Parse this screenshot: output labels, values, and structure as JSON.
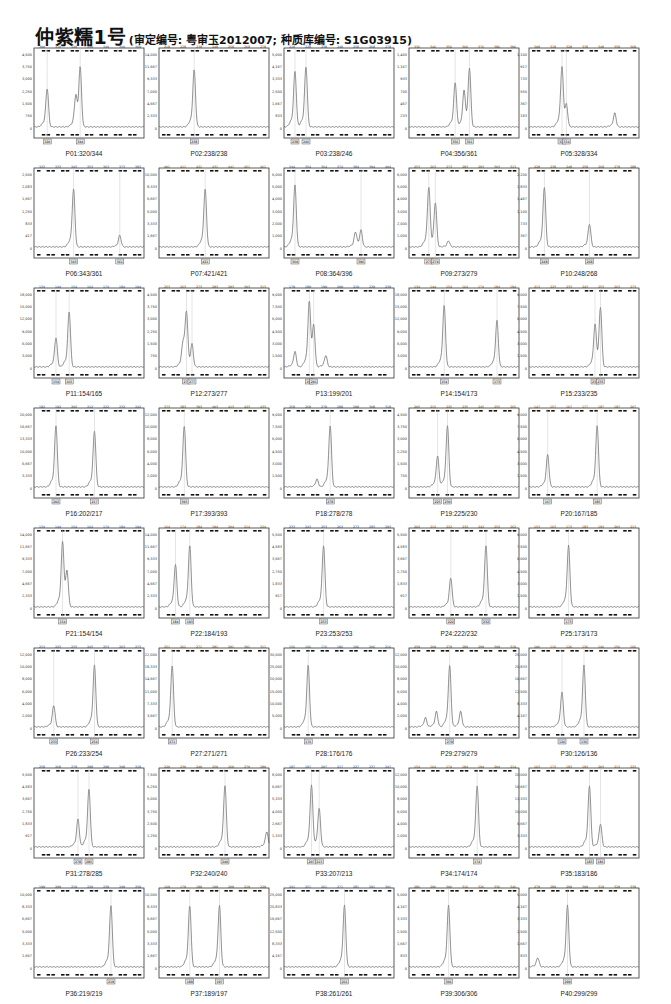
{
  "header": {
    "title": "仲紫糯1号",
    "subtitle": "(审定编号: 粤审玉2012007; 种质库编号: S1G03915)"
  },
  "chart_data": {
    "type": "line",
    "layout": {
      "rows": 8,
      "cols": 5,
      "grid": false,
      "legend": "none"
    },
    "panels": [
      {
        "id": "P01",
        "label": "P01:320/344",
        "alleles": [
          320,
          344
        ],
        "ymax": 4500,
        "peaks": [
          {
            "x": 0.12,
            "h": 0.5
          },
          {
            "x": 0.38,
            "h": 0.34
          },
          {
            "x": 0.42,
            "h": 0.78
          }
        ]
      },
      {
        "id": "P02",
        "label": "P02:238/238",
        "alleles": [
          238,
          238
        ],
        "ymax": 14000,
        "peaks": [
          {
            "x": 0.32,
            "h": 0.74
          }
        ]
      },
      {
        "id": "P03",
        "label": "P03:238/246",
        "alleles": [
          238,
          246
        ],
        "ymax": 5000,
        "peaks": [
          {
            "x": 0.1,
            "h": 0.72
          },
          {
            "x": 0.2,
            "h": 0.78
          }
        ]
      },
      {
        "id": "P04",
        "label": "P04:356/361",
        "alleles": [
          356,
          361
        ],
        "ymax": 1400,
        "peaks": [
          {
            "x": 0.42,
            "h": 0.58
          },
          {
            "x": 0.5,
            "h": 0.42
          },
          {
            "x": 0.55,
            "h": 0.77
          }
        ]
      },
      {
        "id": "P05",
        "label": "P05:328/334",
        "alleles": [
          328,
          334
        ],
        "ymax": 1100,
        "peaks": [
          {
            "x": 0.3,
            "h": 0.75
          },
          {
            "x": 0.34,
            "h": 0.3
          },
          {
            "x": 0.78,
            "h": 0.18
          }
        ]
      },
      {
        "id": "P06",
        "label": "P06:343/361",
        "alleles": [
          343,
          361
        ],
        "ymax": 2500,
        "peaks": [
          {
            "x": 0.36,
            "h": 0.75
          },
          {
            "x": 0.78,
            "h": 0.15
          }
        ]
      },
      {
        "id": "P07",
        "label": "P07:421/421",
        "alleles": [
          421,
          421
        ],
        "ymax": 10000,
        "peaks": [
          {
            "x": 0.42,
            "h": 0.75
          }
        ]
      },
      {
        "id": "P08",
        "label": "P08:364/396",
        "alleles": [
          364,
          396
        ],
        "ymax": 6000,
        "peaks": [
          {
            "x": 0.1,
            "h": 0.8
          },
          {
            "x": 0.65,
            "h": 0.18
          },
          {
            "x": 0.7,
            "h": 0.22
          }
        ]
      },
      {
        "id": "P09",
        "label": "P09:273/279",
        "alleles": [
          273,
          279
        ],
        "ymax": 6000,
        "peaks": [
          {
            "x": 0.18,
            "h": 0.76
          },
          {
            "x": 0.24,
            "h": 0.58
          },
          {
            "x": 0.36,
            "h": 0.08
          }
        ]
      },
      {
        "id": "P10",
        "label": "P10:248/268",
        "alleles": [
          248,
          268
        ],
        "ymax": 2200,
        "peaks": [
          {
            "x": 0.14,
            "h": 0.78
          },
          {
            "x": 0.55,
            "h": 0.3
          }
        ]
      },
      {
        "id": "P11",
        "label": "P11:154/165",
        "alleles": [
          154,
          165
        ],
        "ymax": 18000,
        "peaks": [
          {
            "x": 0.2,
            "h": 0.38
          },
          {
            "x": 0.32,
            "h": 0.72
          }
        ]
      },
      {
        "id": "P12",
        "label": "P12:273/277",
        "alleles": [
          273,
          277
        ],
        "ymax": 4500,
        "peaks": [
          {
            "x": 0.22,
            "h": 0.25
          },
          {
            "x": 0.25,
            "h": 0.7
          },
          {
            "x": 0.3,
            "h": 0.3
          }
        ]
      },
      {
        "id": "P13",
        "label": "P13:199/201",
        "alleles": [
          199,
          201
        ],
        "ymax": 9000,
        "peaks": [
          {
            "x": 0.1,
            "h": 0.2
          },
          {
            "x": 0.23,
            "h": 0.8
          },
          {
            "x": 0.27,
            "h": 0.55
          },
          {
            "x": 0.38,
            "h": 0.15
          }
        ]
      },
      {
        "id": "P14",
        "label": "P14:154/173",
        "alleles": [
          154,
          173
        ],
        "ymax": 18000,
        "peaks": [
          {
            "x": 0.32,
            "h": 0.8
          },
          {
            "x": 0.8,
            "h": 0.6
          }
        ]
      },
      {
        "id": "P15",
        "label": "P15:233/235",
        "alleles": [
          233,
          235
        ],
        "ymax": 9000,
        "peaks": [
          {
            "x": 0.6,
            "h": 0.5
          },
          {
            "x": 0.65,
            "h": 0.78
          }
        ]
      },
      {
        "id": "P16",
        "label": "P16:202/217",
        "alleles": [
          202,
          217
        ],
        "ymax": 20000,
        "peaks": [
          {
            "x": 0.2,
            "h": 0.8
          },
          {
            "x": 0.55,
            "h": 0.73
          }
        ]
      },
      {
        "id": "P17",
        "label": "P17:393/393",
        "alleles": [
          393,
          393
        ],
        "ymax": 12000,
        "peaks": [
          {
            "x": 0.23,
            "h": 0.8
          }
        ]
      },
      {
        "id": "P18",
        "label": "P18:278/278",
        "alleles": [
          278,
          278
        ],
        "ymax": 9000,
        "peaks": [
          {
            "x": 0.3,
            "h": 0.1
          },
          {
            "x": 0.42,
            "h": 0.8
          }
        ]
      },
      {
        "id": "P19",
        "label": "P19:225/230",
        "alleles": [
          225,
          230
        ],
        "ymax": 4500,
        "peaks": [
          {
            "x": 0.26,
            "h": 0.4
          },
          {
            "x": 0.35,
            "h": 0.8
          }
        ]
      },
      {
        "id": "P20",
        "label": "P20:167/185",
        "alleles": [
          167,
          185
        ],
        "ymax": 9000,
        "peaks": [
          {
            "x": 0.17,
            "h": 0.42
          },
          {
            "x": 0.62,
            "h": 0.8
          }
        ]
      },
      {
        "id": "P21",
        "label": "P21:154/154",
        "alleles": [
          154,
          154
        ],
        "ymax": 14000,
        "peaks": [
          {
            "x": 0.26,
            "h": 0.8
          },
          {
            "x": 0.3,
            "h": 0.48
          }
        ]
      },
      {
        "id": "P22",
        "label": "P22:184/193",
        "alleles": [
          184,
          193
        ],
        "ymax": 14000,
        "peaks": [
          {
            "x": 0.15,
            "h": 0.55
          },
          {
            "x": 0.28,
            "h": 0.8
          }
        ]
      },
      {
        "id": "P23",
        "label": "P23:253/253",
        "alleles": [
          253,
          253
        ],
        "ymax": 5500,
        "peaks": [
          {
            "x": 0.36,
            "h": 0.8
          }
        ]
      },
      {
        "id": "P24",
        "label": "P24:222/232",
        "alleles": [
          222,
          232
        ],
        "ymax": 5500,
        "peaks": [
          {
            "x": 0.38,
            "h": 0.38
          },
          {
            "x": 0.7,
            "h": 0.8
          }
        ]
      },
      {
        "id": "P25",
        "label": "P25:173/173",
        "alleles": [
          173,
          173
        ],
        "ymax": 9000,
        "peaks": [
          {
            "x": 0.36,
            "h": 0.8
          }
        ]
      },
      {
        "id": "P26",
        "label": "P26:233/254",
        "alleles": [
          233,
          254
        ],
        "ymax": 12000,
        "peaks": [
          {
            "x": 0.18,
            "h": 0.28
          },
          {
            "x": 0.55,
            "h": 0.8
          }
        ]
      },
      {
        "id": "P27",
        "label": "P27:271/271",
        "alleles": [
          271,
          271
        ],
        "ymax": 22000,
        "peaks": [
          {
            "x": 0.12,
            "h": 0.8
          }
        ]
      },
      {
        "id": "P28",
        "label": "P28:176/176",
        "alleles": [
          176,
          176
        ],
        "ymax": 30000,
        "peaks": [
          {
            "x": 0.22,
            "h": 0.8
          }
        ]
      },
      {
        "id": "P29",
        "label": "P29:279/279",
        "alleles": [
          279,
          279
        ],
        "ymax": 12000,
        "peaks": [
          {
            "x": 0.15,
            "h": 0.12
          },
          {
            "x": 0.25,
            "h": 0.2
          },
          {
            "x": 0.37,
            "h": 0.8
          },
          {
            "x": 0.47,
            "h": 0.2
          }
        ]
      },
      {
        "id": "P30",
        "label": "P30:126/136",
        "alleles": [
          126,
          136
        ],
        "ymax": 25000,
        "peaks": [
          {
            "x": 0.3,
            "h": 0.45
          },
          {
            "x": 0.5,
            "h": 0.8
          }
        ]
      },
      {
        "id": "P31",
        "label": "P31:278/285",
        "alleles": [
          278,
          285
        ],
        "ymax": 5500,
        "peaks": [
          {
            "x": 0.4,
            "h": 0.36
          },
          {
            "x": 0.5,
            "h": 0.75
          }
        ]
      },
      {
        "id": "P32",
        "label": "P32:240/240",
        "alleles": [
          240,
          240
        ],
        "ymax": 7500,
        "peaks": [
          {
            "x": 0.6,
            "h": 0.8
          },
          {
            "x": 0.98,
            "h": 0.2
          }
        ]
      },
      {
        "id": "P33",
        "label": "P33:207/213",
        "alleles": [
          207,
          213
        ],
        "ymax": 8000,
        "peaks": [
          {
            "x": 0.25,
            "h": 0.8
          },
          {
            "x": 0.32,
            "h": 0.5
          }
        ]
      },
      {
        "id": "P34",
        "label": "P34:174/174",
        "alleles": [
          174,
          174
        ],
        "ymax": 12000,
        "peaks": [
          {
            "x": 0.62,
            "h": 0.8
          }
        ]
      },
      {
        "id": "P35",
        "label": "P35:183/186",
        "alleles": [
          183,
          186
        ],
        "ymax": 20000,
        "peaks": [
          {
            "x": 0.55,
            "h": 0.8
          },
          {
            "x": 0.65,
            "h": 0.3
          }
        ]
      },
      {
        "id": "P36",
        "label": "P36:219/219",
        "alleles": [
          219,
          219
        ],
        "ymax": 10000,
        "peaks": [
          {
            "x": 0.7,
            "h": 0.8
          }
        ]
      },
      {
        "id": "P37",
        "label": "P37:189/197",
        "alleles": [
          189,
          197
        ],
        "ymax": 10000,
        "peaks": [
          {
            "x": 0.28,
            "h": 0.8
          },
          {
            "x": 0.55,
            "h": 0.8
          }
        ]
      },
      {
        "id": "P38",
        "label": "P38:261/261",
        "alleles": [
          261,
          261
        ],
        "ymax": 25000,
        "peaks": [
          {
            "x": 0.55,
            "h": 0.8
          }
        ]
      },
      {
        "id": "P39",
        "label": "P39:306/306",
        "alleles": [
          306,
          306
        ],
        "ymax": 5000,
        "peaks": [
          {
            "x": 0.36,
            "h": 0.8
          }
        ]
      },
      {
        "id": "P40",
        "label": "P40:299/299",
        "alleles": [
          299,
          299
        ],
        "ymax": 5000,
        "peaks": [
          {
            "x": 0.08,
            "h": 0.12
          },
          {
            "x": 0.35,
            "h": 0.8
          }
        ]
      }
    ]
  }
}
